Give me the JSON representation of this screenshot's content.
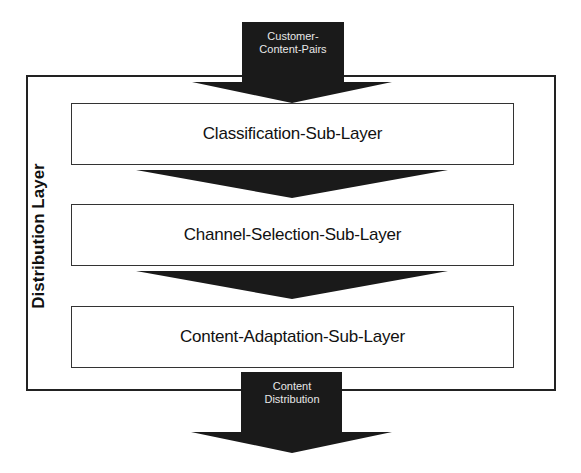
{
  "diagram": {
    "input_arrow": {
      "label_line1": "Customer-",
      "label_line2": "Content-Pairs"
    },
    "container": {
      "label": "Distribution Layer"
    },
    "sublayers": [
      {
        "label": "Classification-Sub-Layer"
      },
      {
        "label": "Channel-Selection-Sub-Layer"
      },
      {
        "label": "Content-Adaptation-Sub-Layer"
      }
    ],
    "output_arrow": {
      "label_line1": "Content",
      "label_line2": "Distribution"
    },
    "colors": {
      "arrow": "#1a1a1a",
      "border": "#222222",
      "background": "#ffffff"
    }
  }
}
